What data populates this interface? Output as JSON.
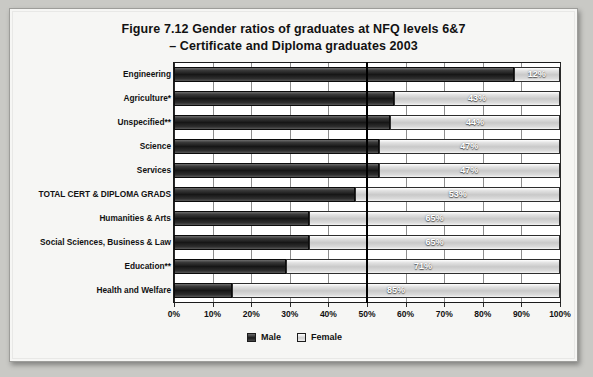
{
  "chart_data": {
    "type": "bar",
    "orientation": "horizontal",
    "stacked": true,
    "stack_total": 100,
    "title": "Figure 7.12   Gender ratios of graduates at NFQ levels 6&7",
    "title_line2": "– Certificate and Diploma graduates 2003",
    "xlabel": "",
    "ylabel": "",
    "xlim": [
      0,
      100
    ],
    "grid": true,
    "reference_line": 50,
    "legend_position": "bottom",
    "categories": [
      "Engineering",
      "Agriculture*",
      "Unspecified**",
      "Science",
      "Services",
      "TOTAL CERT & DIPLOMA GRADS",
      "Humanities & Arts",
      "Social Sciences, Business & Law",
      "Education**",
      "Health and Welfare"
    ],
    "series": [
      {
        "name": "Male",
        "color": "#191919",
        "values": [
          88,
          57,
          56,
          53,
          53,
          47,
          35,
          35,
          29,
          15
        ]
      },
      {
        "name": "Female",
        "color": "#cfcfcf",
        "values": [
          12,
          43,
          44,
          47,
          47,
          53,
          65,
          65,
          71,
          85
        ]
      }
    ],
    "data_labels": [
      "12%",
      "43%",
      "44%",
      "47%",
      "47%",
      "53%",
      "65%",
      "65%",
      "71%",
      "85%"
    ],
    "xticks": [
      0,
      10,
      20,
      30,
      40,
      50,
      60,
      70,
      80,
      90,
      100
    ],
    "xtick_labels": [
      "0%",
      "10%",
      "20%",
      "30%",
      "40%",
      "50%",
      "60%",
      "70%",
      "80%",
      "90%",
      "100%"
    ]
  },
  "legend": {
    "items": [
      {
        "label": "Male"
      },
      {
        "label": "Female"
      }
    ]
  }
}
